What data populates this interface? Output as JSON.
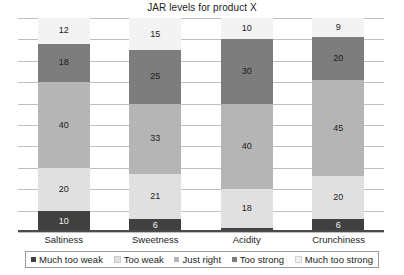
{
  "chart_data": {
    "type": "bar",
    "subtype": "stacked-bar-100",
    "title": "JAR levels for product X",
    "xlabel": "",
    "ylabel": "",
    "ylim": [
      0,
      100
    ],
    "grid": true,
    "gridline_count": 10,
    "legend_position": "bottom",
    "categories": [
      "Saltiness",
      "Sweetness",
      "Acidity",
      "Crunchiness"
    ],
    "series": [
      {
        "name": "Much too weak",
        "color": "#404040",
        "values": [
          10,
          6,
          2,
          6
        ]
      },
      {
        "name": "Too weak",
        "color": "#e0e0e0",
        "values": [
          20,
          21,
          18,
          20
        ]
      },
      {
        "name": "Just right",
        "color": "#b5b5b5",
        "values": [
          40,
          33,
          40,
          45
        ]
      },
      {
        "name": "Too strong",
        "color": "#7d7d7d",
        "values": [
          18,
          25,
          30,
          20
        ]
      },
      {
        "name": "Much too strong",
        "color": "#f3f3f3",
        "values": [
          12,
          15,
          10,
          9
        ]
      }
    ]
  },
  "colors": {
    "gridline": "#bfbfbf",
    "axis": "#4a4a4a",
    "text": "#1d1d1d",
    "background": "#ffffff"
  }
}
